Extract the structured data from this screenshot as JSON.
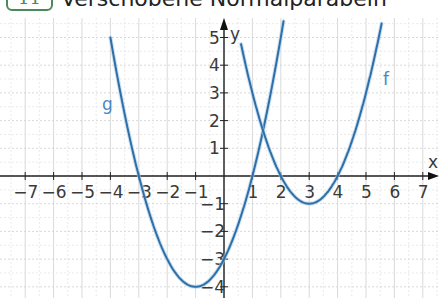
{
  "header": {
    "task_number": "11",
    "title": "Verschobene Normalparabeln"
  },
  "chart_data": {
    "type": "line",
    "title": "Verschobene Normalparabeln",
    "xlabel": "x",
    "ylabel": "y",
    "xlim": [
      -7.9,
      7.5
    ],
    "ylim": [
      -4.4,
      5.6
    ],
    "grid": true,
    "x_ticks": [
      -7,
      -6,
      -5,
      -4,
      -3,
      -2,
      -1,
      1,
      2,
      3,
      4,
      5,
      6,
      7
    ],
    "y_ticks": [
      -4,
      -3,
      -2,
      -1,
      1,
      2,
      3,
      4,
      5
    ],
    "series": [
      {
        "name": "g",
        "equation": "g(x) = (x+1)^2 - 4",
        "vertex": [
          -1,
          -4
        ],
        "x": [
          -4,
          -3.5,
          -3,
          -2.5,
          -2,
          -1.5,
          -1,
          -0.5,
          0,
          0.5,
          1,
          1.5,
          2,
          2.35
        ],
        "values": [
          5,
          2.25,
          0,
          -1.75,
          -3,
          -3.75,
          -4,
          -3.75,
          -3,
          -1.75,
          0,
          2.25,
          5,
          5.6
        ],
        "color": "#2f6fa8",
        "label_position": [
          -4.3,
          2.4
        ]
      },
      {
        "name": "f",
        "equation": "f(x) = (x-3)^2 - 1",
        "vertex": [
          3,
          -1
        ],
        "x": [
          0.6,
          1,
          1.5,
          2,
          2.5,
          3,
          3.5,
          4,
          4.5,
          5,
          5.5,
          5.6
        ],
        "values": [
          4.76,
          3,
          1.25,
          0,
          -0.75,
          -1,
          -0.75,
          0,
          1.25,
          3,
          5.25,
          5.76
        ],
        "color": "#2f6fa8",
        "label_position": [
          5.6,
          3.3
        ]
      }
    ],
    "intersection": [
      1.375,
      1.64
    ]
  }
}
